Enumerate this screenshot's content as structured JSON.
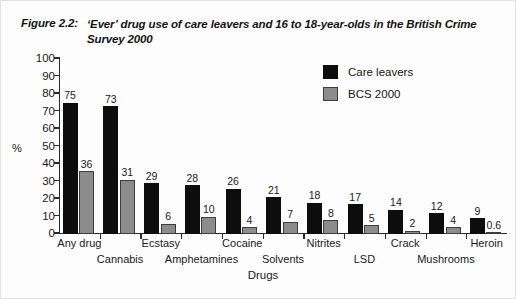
{
  "figure": {
    "number": "Figure 2.2:",
    "caption": "‘Ever’ drug use of care leavers and 16 to 18-year-olds in the British Crime Survey 2000"
  },
  "legend": {
    "items": [
      {
        "label": "Care leavers",
        "color": "#0d0d0d"
      },
      {
        "label": "BCS 2000",
        "color": "#8c8c8c"
      }
    ]
  },
  "axes": {
    "ylabel": "%",
    "xlabel": "Drugs",
    "yticks": [
      "0",
      "10",
      "20",
      "30",
      "40",
      "50",
      "60",
      "70",
      "80",
      "90",
      "100"
    ]
  },
  "chart_data": {
    "type": "bar",
    "title": "‘Ever’ drug use of care leavers and 16 to 18-year-olds in the British Crime Survey 2000",
    "xlabel": "Drugs",
    "ylabel": "%",
    "ylim": [
      0,
      100
    ],
    "ytick_step": 10,
    "grid": false,
    "legend_position": "top-right",
    "categories": [
      "Any drug",
      "Cannabis",
      "Ecstasy",
      "Amphetamines",
      "Cocaine",
      "Solvents",
      "Nitrites",
      "LSD",
      "Crack",
      "Mushrooms",
      "Heroin"
    ],
    "series": [
      {
        "name": "Care leavers",
        "color": "#0d0d0d",
        "values": [
          75,
          73,
          29,
          28,
          26,
          21,
          18,
          17,
          14,
          12,
          9
        ],
        "labels": [
          "75",
          "73",
          "29",
          "28",
          "26",
          "21",
          "18",
          "17",
          "14",
          "12",
          "9"
        ]
      },
      {
        "name": "BCS 2000",
        "color": "#8c8c8c",
        "values": [
          36,
          31,
          6,
          10,
          4,
          7,
          8,
          5,
          2,
          4,
          0.6
        ],
        "labels": [
          "36",
          "31",
          "6",
          "10",
          "4",
          "7",
          "8",
          "5",
          "2",
          "4",
          "0.6"
        ]
      }
    ]
  }
}
